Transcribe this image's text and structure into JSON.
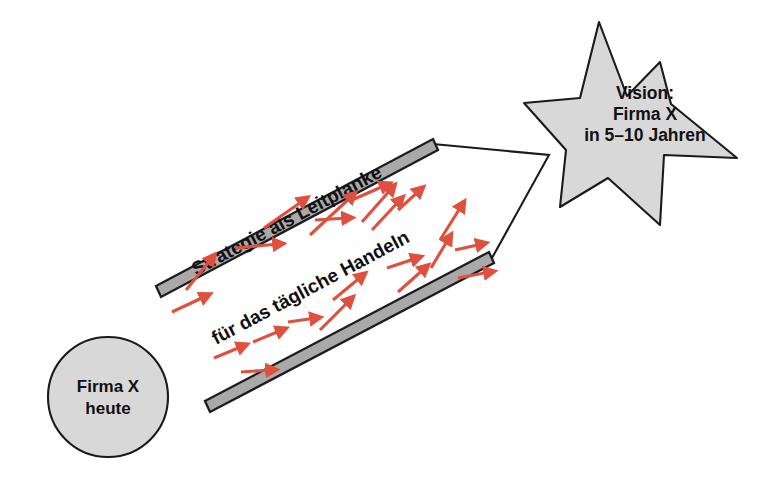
{
  "diagram": {
    "title": "Strategie als Leitplanke für das tägliche Handeln",
    "background_color": "#ffffff",
    "shape_fill_color": "#d8d8d8",
    "bar_fill_color": "#a9a9a9",
    "outline_color": "#1a1a1a",
    "arrow_color": "#e0503e"
  },
  "start_node": {
    "name": "start-circle",
    "shape": "circle",
    "line1": "Firma X",
    "line2": "heute",
    "center_x": 108,
    "center_y": 397,
    "radius": 60
  },
  "end_node": {
    "name": "vision-star",
    "shape": "star",
    "line1": "Vision:",
    "line2": "Firma X",
    "line3": "in 5–10 Jahren",
    "center_x": 645,
    "center_y": 120,
    "points": 7
  },
  "guardrails": {
    "upper_label": "Strategie als Leitplanke",
    "lower_label": "für das tägliche Handeln",
    "upper_bar": {
      "x1": 158,
      "y1": 292,
      "x2": 436,
      "y2": 145
    },
    "lower_bar": {
      "x1": 207,
      "y1": 407,
      "x2": 492,
      "y2": 259
    },
    "rotation_degrees": -28
  },
  "funnel": {
    "upper_path": "M 433 144 L 549 155 L 492 258",
    "description": "converging lines from guardrail ends to the vision star"
  },
  "flow_arrows": {
    "count": 22,
    "color": "#e0503e",
    "meaning": "daily actions moving toward the vision",
    "items": [
      {
        "x1": 172,
        "y1": 312,
        "x2": 206,
        "y2": 296
      },
      {
        "x1": 186,
        "y1": 290,
        "x2": 212,
        "y2": 258
      },
      {
        "x1": 235,
        "y1": 248,
        "x2": 279,
        "y2": 244
      },
      {
        "x1": 264,
        "y1": 228,
        "x2": 304,
        "y2": 200
      },
      {
        "x1": 315,
        "y1": 220,
        "x2": 348,
        "y2": 218
      },
      {
        "x1": 310,
        "y1": 235,
        "x2": 352,
        "y2": 196
      },
      {
        "x1": 352,
        "y1": 200,
        "x2": 386,
        "y2": 185
      },
      {
        "x1": 362,
        "y1": 222,
        "x2": 392,
        "y2": 188
      },
      {
        "x1": 372,
        "y1": 230,
        "x2": 400,
        "y2": 200
      },
      {
        "x1": 398,
        "y1": 210,
        "x2": 420,
        "y2": 190
      },
      {
        "x1": 440,
        "y1": 240,
        "x2": 462,
        "y2": 205
      },
      {
        "x1": 431,
        "y1": 268,
        "x2": 449,
        "y2": 238
      },
      {
        "x1": 387,
        "y1": 268,
        "x2": 417,
        "y2": 258
      },
      {
        "x1": 398,
        "y1": 292,
        "x2": 425,
        "y2": 268
      },
      {
        "x1": 333,
        "y1": 300,
        "x2": 362,
        "y2": 276
      },
      {
        "x1": 320,
        "y1": 330,
        "x2": 350,
        "y2": 300
      },
      {
        "x1": 288,
        "y1": 322,
        "x2": 316,
        "y2": 318
      },
      {
        "x1": 253,
        "y1": 342,
        "x2": 282,
        "y2": 330
      },
      {
        "x1": 214,
        "y1": 358,
        "x2": 243,
        "y2": 346
      },
      {
        "x1": 241,
        "y1": 372,
        "x2": 272,
        "y2": 370
      },
      {
        "x1": 458,
        "y1": 278,
        "x2": 490,
        "y2": 272
      },
      {
        "x1": 455,
        "y1": 250,
        "x2": 482,
        "y2": 244
      }
    ]
  }
}
